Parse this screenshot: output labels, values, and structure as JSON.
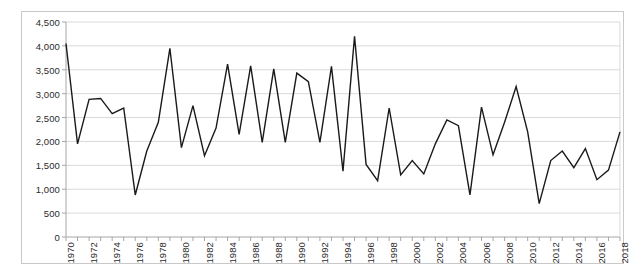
{
  "chart_data": {
    "type": "line",
    "title": "",
    "subtitle": "",
    "xlabel": "",
    "ylabel": "",
    "xlim": [
      1970,
      2018
    ],
    "ylim": [
      0,
      4500
    ],
    "grid": true,
    "legend": false,
    "legend_position": "none",
    "line_color": "#1a1a1a",
    "grid_color": "#d9d9d9",
    "axis_color": "#a6a6a6",
    "frame_color": "#c9c9c9",
    "background_color": "#ffffff",
    "ytick_labels": [
      "4,500",
      "4,000",
      "3,500",
      "3,000",
      "2,500",
      "2,000",
      "1,500",
      "1,000",
      "500",
      "0"
    ],
    "ytick_values": [
      4500,
      4000,
      3500,
      3000,
      2500,
      2000,
      1500,
      1000,
      500,
      0
    ],
    "ytick_step": 500,
    "xtick_labels": [
      "1970",
      "1972",
      "1974",
      "1976",
      "1978",
      "1980",
      "1982",
      "1984",
      "1986",
      "1988",
      "1990",
      "1992",
      "1994",
      "1996",
      "1998",
      "2000",
      "2002",
      "2004",
      "2006",
      "2008",
      "2010",
      "2012",
      "2014",
      "2016",
      "2018"
    ],
    "xtick_label_step": 2,
    "xtick_minor_step": 1,
    "x": [
      1970,
      1971,
      1972,
      1973,
      1974,
      1975,
      1976,
      1977,
      1978,
      1979,
      1980,
      1981,
      1982,
      1983,
      1984,
      1985,
      1986,
      1987,
      1988,
      1989,
      1990,
      1991,
      1992,
      1993,
      1994,
      1995,
      1996,
      1997,
      1998,
      1999,
      2000,
      2001,
      2002,
      2003,
      2004,
      2005,
      2006,
      2007,
      2008,
      2009,
      2010,
      2011,
      2012,
      2013,
      2014,
      2015,
      2016,
      2017,
      2018
    ],
    "values": [
      4050,
      1950,
      2880,
      2900,
      2580,
      2700,
      880,
      1800,
      2400,
      3950,
      1870,
      2750,
      1700,
      2280,
      3620,
      2150,
      3580,
      1980,
      3520,
      1980,
      3430,
      3250,
      1980,
      3570,
      1380,
      4200,
      1520,
      1180,
      2700,
      1300,
      1600,
      1320,
      1950,
      2450,
      2330,
      880,
      2720,
      1720,
      2400,
      3150,
      2200,
      700,
      1600,
      1800,
      1450,
      1850,
      1200,
      1400,
      2200
    ],
    "series": [
      {
        "name": "series-1",
        "values": [
          4050,
          1950,
          2880,
          2900,
          2580,
          2700,
          880,
          1800,
          2400,
          3950,
          1870,
          2750,
          1700,
          2280,
          3620,
          2150,
          3580,
          1980,
          3520,
          1980,
          3430,
          3250,
          1980,
          3570,
          1380,
          4200,
          1520,
          1180,
          2700,
          1300,
          1600,
          1320,
          1950,
          2450,
          2330,
          880,
          2720,
          1720,
          2400,
          3150,
          2200,
          700,
          1600,
          1800,
          1450,
          1850,
          1200,
          1400,
          2200
        ]
      }
    ],
    "annotations": []
  }
}
